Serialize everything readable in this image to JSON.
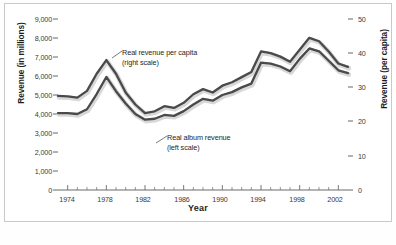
{
  "chart_data": {
    "type": "line",
    "title": "",
    "xlabel": "Year",
    "ylabel": "Revenue (in millions)",
    "ylabel_right": "Revenue (per capita)",
    "xlim": [
      1973,
      2003
    ],
    "ylim": [
      0,
      9000
    ],
    "ylim_right": [
      0,
      50
    ],
    "grid": false,
    "legend_position": "inline-annotations",
    "x": [
      1973,
      1974,
      1975,
      1976,
      1977,
      1978,
      1979,
      1980,
      1981,
      1982,
      1983,
      1984,
      1985,
      1986,
      1987,
      1988,
      1989,
      1990,
      1991,
      1992,
      1993,
      1994,
      1995,
      1996,
      1997,
      1998,
      1999,
      2000,
      2001,
      2002,
      2003
    ],
    "xticks": [
      1974,
      1978,
      1982,
      1986,
      1990,
      1994,
      1998,
      2002
    ],
    "yticks_left": [
      "0",
      "1,000",
      "2,000",
      "3,000",
      "4,000",
      "5,000",
      "6,000",
      "7,000",
      "8,000",
      "9,000"
    ],
    "yticks_right": [
      "0",
      "10",
      "20",
      "30",
      "40",
      "50"
    ],
    "series": [
      {
        "name": "Real revenue per capita",
        "scale": "right",
        "annotation": "Real revenue per capita",
        "annotation_sub": "(right scale)",
        "color": "#4a4a4a",
        "values": [
          27.5,
          27.4,
          27.0,
          29.0,
          34.0,
          38.0,
          34.0,
          28.5,
          25.0,
          22.5,
          23.0,
          24.5,
          24.0,
          25.5,
          28.0,
          29.5,
          28.5,
          30.5,
          31.5,
          33.0,
          34.5,
          40.5,
          40.0,
          39.0,
          37.5,
          41.0,
          44.5,
          43.5,
          40.5,
          37.0,
          36.0
        ]
      },
      {
        "name": "Real album revenue",
        "scale": "left",
        "annotation": "Real album revenue",
        "annotation_sub": "(left scale)",
        "color": "#4a4a4a",
        "values": [
          4050,
          4050,
          4000,
          4250,
          5050,
          5950,
          5200,
          4550,
          4000,
          3700,
          3750,
          3950,
          3900,
          4150,
          4500,
          4800,
          4700,
          5000,
          5150,
          5400,
          5600,
          6700,
          6650,
          6500,
          6250,
          6900,
          7450,
          7300,
          6800,
          6300,
          6150
        ]
      }
    ]
  },
  "axes": {
    "left_title": "Revenue (in millions)",
    "right_title": "Revenue (per capita)",
    "x_title": "Year"
  },
  "annotations": [
    {
      "line1": "Real revenue per capita",
      "line2": "(right scale)"
    },
    {
      "line1": "Real album revenue",
      "line2": "(left scale)"
    }
  ]
}
